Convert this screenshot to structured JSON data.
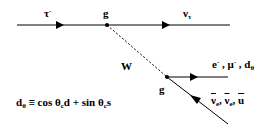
{
  "diagram": {
    "type": "feynman-diagram",
    "line_color": "#000000",
    "labels": {
      "incoming": {
        "base": "τ",
        "sup": "-"
      },
      "vertex_top": "g",
      "outgoing_top": {
        "base": "ν",
        "sub": "τ"
      },
      "boson": "W",
      "vertex_bottom": "g",
      "outgoing_upper": {
        "p1": "e",
        "p1_sup": "-",
        "sep1": " , ",
        "p2": "μ",
        "p2_sup": "-",
        "sep2": " , ",
        "p3": "d",
        "p3_sub": "θ"
      },
      "outgoing_lower": {
        "p1": "ν",
        "p1_sub": "e",
        "sep1": ", ",
        "p2": "ν",
        "p2_sub": "e",
        "sep2": ", ",
        "p3": "u"
      }
    },
    "formula": {
      "lhs": "d",
      "lhs_sub": "θ",
      "eq": " ≡ cos θ",
      "sub1": "c",
      "mid": "d + sin θ",
      "sub2": "c",
      "end": "s"
    }
  }
}
